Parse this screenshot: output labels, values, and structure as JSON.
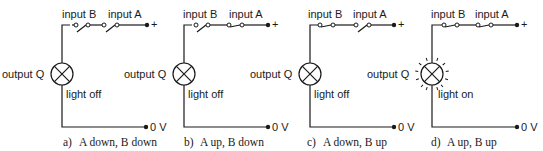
{
  "figure": {
    "panels": [
      {
        "id": "a",
        "caption_letter": "a)",
        "caption_text": "A down, B down",
        "input_b_label": "input B",
        "input_a_label": "input A",
        "switch_b_state": "open",
        "switch_a_state": "open",
        "output_label": "output Q",
        "light_label": "light off",
        "light_state": "off",
        "plus_label": "+",
        "zero_label": "0 V"
      },
      {
        "id": "b",
        "caption_letter": "b)",
        "caption_text": "A up, B down",
        "input_b_label": "input B",
        "input_a_label": "input A",
        "switch_b_state": "open",
        "switch_a_state": "closed",
        "output_label": "output Q",
        "light_label": "light off",
        "light_state": "off",
        "plus_label": "+",
        "zero_label": "0 V"
      },
      {
        "id": "c",
        "caption_letter": "c)",
        "caption_text": "A down, B up",
        "input_b_label": "input B",
        "input_a_label": "input A",
        "switch_b_state": "closed",
        "switch_a_state": "open",
        "output_label": "output Q",
        "light_label": "light off",
        "light_state": "off",
        "plus_label": "+",
        "zero_label": "0 V"
      },
      {
        "id": "d",
        "caption_letter": "d)",
        "caption_text": "A up, B up",
        "input_b_label": "input B",
        "input_a_label": "input A",
        "switch_b_state": "closed",
        "switch_a_state": "closed",
        "output_label": "output Q",
        "light_label": "light on",
        "light_state": "on",
        "plus_label": "+",
        "zero_label": "0 V"
      }
    ],
    "colors": {
      "ink": "#1a1a1a",
      "background": "#ffffff"
    }
  }
}
